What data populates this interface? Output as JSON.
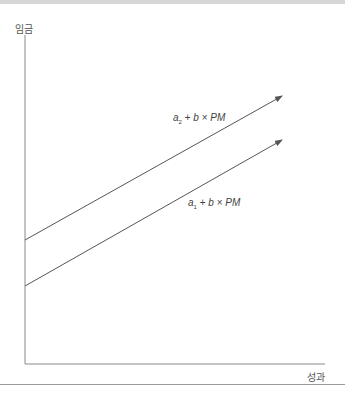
{
  "diagram": {
    "y_axis_label": "임금",
    "x_axis_label": "성과",
    "lines": [
      {
        "name": "a2-line",
        "label_a": "a",
        "label_sub": "2",
        "label_rest_plus": "+",
        "label_b": "b",
        "label_times": "×",
        "label_pm": "PM",
        "intercept_y": 240,
        "end": [
          282,
          96
        ]
      },
      {
        "name": "a1-line",
        "label_a": "a",
        "label_sub": "1",
        "label_rest_plus": "+",
        "label_b": "b",
        "label_times": "×",
        "label_pm": "PM",
        "intercept_y": 286,
        "end": [
          282,
          140
        ]
      }
    ],
    "colors": {
      "axis": "#8a8a8a",
      "line": "#555555",
      "text": "#555555"
    }
  }
}
